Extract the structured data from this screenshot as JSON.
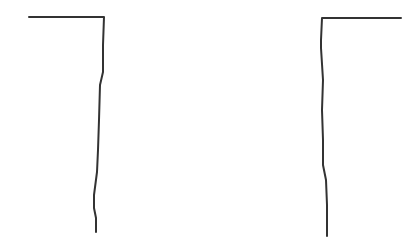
{
  "canvas": {
    "width": 414,
    "height": 248,
    "background": "#ffffff"
  },
  "style": {
    "stroke_color": "#333333",
    "stroke_width": 2
  },
  "shapes": [
    {
      "name": "left-hook",
      "points": "29,17 104,17 103,45 103,72 100,85 99,120 98,150 97,172 94,195 94,208 96,218 96,232"
    },
    {
      "name": "right-hook",
      "points": "401,18 322,18 321,40 321,48 323,80 322,110 323,140 323,165 326,180 327,205 327,236"
    }
  ]
}
